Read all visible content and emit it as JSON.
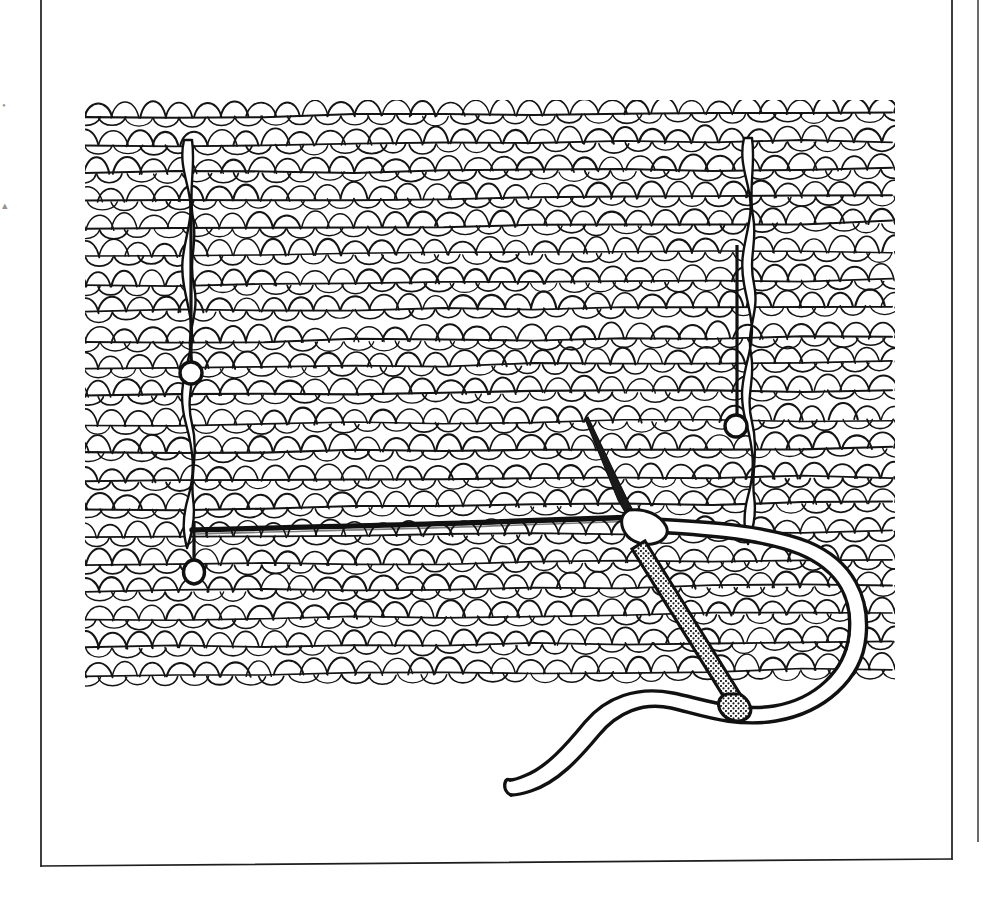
{
  "page": {
    "width": 983,
    "height": 907,
    "background_color": "#ffffff",
    "ink_color": "#111111",
    "media": "scanned line drawing"
  },
  "frame": {
    "name": "page-border-rule",
    "left_rule_x": 41,
    "inner_right_rule_x": 952,
    "outer_right_rule_x": 978,
    "bottom_rule_y": 866,
    "bottom_rule_y_right": 858,
    "stroke_color": "#1d1d1d",
    "stroke_width": 1.6
  },
  "margin_marks": {
    "name": "cropped-marginal-glyphs",
    "items": [
      {
        "label": "•",
        "x": 2,
        "y": 100
      },
      {
        "label": "▴",
        "x": 2,
        "y": 200
      }
    ]
  },
  "fabric": {
    "name": "knitted-swatch",
    "description": "stockinette stitch fabric, V / arch shaped loops in horizontal courses",
    "left": 85,
    "top": 102,
    "right": 892,
    "bottom": 692,
    "rows": 21,
    "row_height": 28,
    "stitches_per_row": 30,
    "stitch_width": 27,
    "stroke_color": "#141414",
    "line_width": 1.5
  },
  "markers": {
    "name": "marker-threads-and-pins",
    "thread_color": "#101010",
    "pin_head_fill": "#ffffff",
    "items": [
      {
        "id": "left-marker-thread",
        "type": "vertical-marker-thread",
        "x": 188,
        "y_top": 140,
        "y_bottom": 545
      },
      {
        "id": "right-marker-thread",
        "type": "vertical-marker-thread",
        "x": 748,
        "y_top": 140,
        "y_bottom": 540
      },
      {
        "id": "pin-upper-left",
        "type": "marker-pin",
        "shaft_x": 191,
        "shaft_top": 200,
        "head_cx": 191,
        "head_cy": 373,
        "head_r": 11
      },
      {
        "id": "pin-lower-left",
        "type": "marker-pin",
        "shaft_x": 194,
        "shaft_top": 521,
        "head_cx": 194,
        "head_cy": 572,
        "head_r": 11
      },
      {
        "id": "pin-right",
        "type": "marker-pin",
        "shaft_x": 737,
        "shaft_top": 245,
        "head_cx": 736,
        "head_cy": 426,
        "head_r": 11
      }
    ]
  },
  "seam": {
    "name": "horizontal-seam-thread",
    "description": "thick dark yarn laid along one course from left pin to the needle",
    "x_start": 192,
    "y_start": 528,
    "x_end": 634,
    "y_end": 518,
    "stroke_width": 5
  },
  "needle": {
    "name": "tapestry-needle",
    "description": "blunt tapestry needle angled down-right, stippled shaft, rounded eye end",
    "point_x": 588,
    "point_y": 417,
    "eye_x": 735,
    "eye_y": 703,
    "shaft_width": 9,
    "texture": "stipple",
    "eye_fill": "#ffffff"
  },
  "yarn": {
    "name": "working-yarn",
    "description": "thick white-filled yarn looping right from the needle, around and back down to a free tail at lower left",
    "stroke_color": "#111111",
    "fill_color": "#ffffff",
    "band_width": 13,
    "tail_end_x": 512,
    "tail_end_y": 789
  },
  "chart_data": null
}
